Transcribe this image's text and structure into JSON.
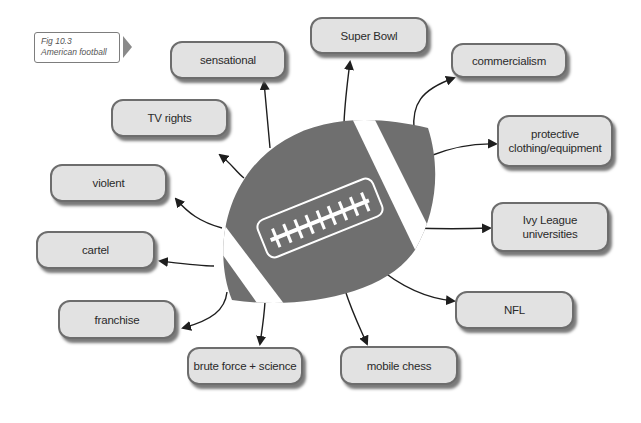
{
  "caption": {
    "line1": "Fig 10.3",
    "line2": "American football"
  },
  "center": {
    "label": "american-football",
    "color": "#6f6f6f",
    "stripe_color": "#ffffff"
  },
  "nodes": [
    {
      "id": "sensational",
      "label": "sensational"
    },
    {
      "id": "super-bowl",
      "label": "Super Bowl"
    },
    {
      "id": "commercialism",
      "label": "commercialism"
    },
    {
      "id": "tv-rights",
      "label": "TV rights"
    },
    {
      "id": "protective",
      "label_line1": "protective",
      "label_line2": "clothing/equipment"
    },
    {
      "id": "violent",
      "label": "violent"
    },
    {
      "id": "ivy-league",
      "label_line1": "Ivy League",
      "label_line2": "universities"
    },
    {
      "id": "cartel",
      "label": "cartel"
    },
    {
      "id": "nfl",
      "label": "NFL"
    },
    {
      "id": "franchise",
      "label": "franchise"
    },
    {
      "id": "brute-force",
      "label": "brute force + science"
    },
    {
      "id": "mobile-chess",
      "label": "mobile chess"
    }
  ],
  "colors": {
    "box_fill": "#e2e2e2",
    "box_border": "#6d6d6d",
    "arrow": "#1e1e1e"
  }
}
